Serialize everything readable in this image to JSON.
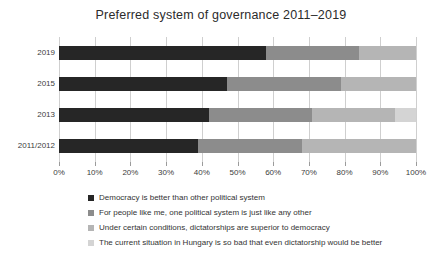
{
  "title": "Preferred system of governance 2011–2019",
  "chart_data": {
    "type": "bar",
    "orientation": "horizontal",
    "stacked": true,
    "title": "Preferred system of governance 2011–2019",
    "categories": [
      "2019",
      "2015",
      "2013",
      "2011/2012"
    ],
    "series": [
      {
        "name": "Democracy is better than other political system",
        "color": "#262626",
        "values": [
          58,
          47,
          42,
          39
        ]
      },
      {
        "name": "For people like me, one political system is just like any other",
        "color": "#8c8c8c",
        "values": [
          26,
          32,
          29,
          29
        ]
      },
      {
        "name": "Under certain conditions, dictatorships are superior to democracy",
        "color": "#b5b5b5",
        "values": [
          16,
          21,
          23,
          32
        ]
      },
      {
        "name": "The current situation in Hungary is so bad that even dictatorship would be better",
        "color": "#d4d4d4",
        "values": [
          0,
          0,
          6,
          0
        ]
      }
    ],
    "xlabel": "",
    "ylabel": "",
    "xlim": [
      0,
      100
    ],
    "x_ticks": [
      "0%",
      "10%",
      "20%",
      "30%",
      "40%",
      "50%",
      "60%",
      "70%",
      "80%",
      "90%",
      "100%"
    ],
    "grid": true,
    "legend_position": "bottom-left"
  },
  "colors": {
    "background": "#ffffff",
    "grid": "#cfcfcf",
    "axis_text": "#3c3c3c",
    "title_text": "#2b2b2b"
  }
}
